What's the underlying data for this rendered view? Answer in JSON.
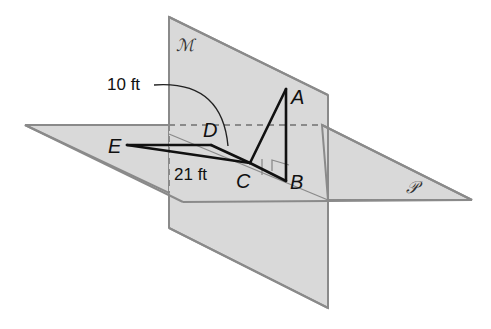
{
  "diagram": {
    "planes": [
      {
        "name": "M",
        "label": "ℳ",
        "orientation": "vertical"
      },
      {
        "name": "P",
        "label": "𝒫",
        "orientation": "horizontal"
      }
    ],
    "points": {
      "A": "A",
      "B": "B",
      "C": "C",
      "D": "D",
      "E": "E"
    },
    "measurements": {
      "arc_DA": "10 ft",
      "segment_EC": "21 ft"
    },
    "right_angle_at": "B",
    "congruent_tick_on": "CB",
    "colors": {
      "plane_fill": "#d9d9d9",
      "plane_edge": "#8a8a8a",
      "segment": "#111111",
      "background": "#ffffff"
    }
  }
}
